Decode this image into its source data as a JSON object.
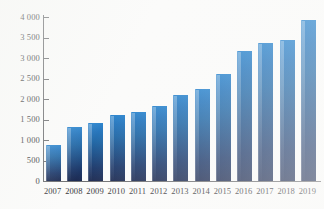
{
  "chart_data": {
    "type": "bar",
    "title": "",
    "xlabel": "",
    "ylabel": "",
    "categories": [
      "2007",
      "2008",
      "2009",
      "2010",
      "2011",
      "2012",
      "2013",
      "2014",
      "2015",
      "2016",
      "2017",
      "2018",
      "2019"
    ],
    "values": [
      880,
      1320,
      1420,
      1620,
      1680,
      1820,
      2100,
      2250,
      2600,
      3180,
      3370,
      3440,
      3930
    ],
    "series": [
      {
        "name": "",
        "values": [
          880,
          1320,
          1420,
          1620,
          1680,
          1820,
          2100,
          2250,
          2600,
          3180,
          3370,
          3440,
          3930
        ]
      }
    ],
    "ylim": [
      0,
      4000
    ],
    "ytick_values": [
      0,
      500,
      1000,
      1500,
      2000,
      2500,
      3000,
      3500,
      4000
    ],
    "ytick_labels": [
      "0",
      "500",
      "1 000",
      "1 500",
      "2 000",
      "2 500",
      "3 000",
      "3 500",
      "4 000"
    ],
    "grid": false,
    "legend": "none",
    "bar_color_top": "#2e86ce",
    "bar_color_bottom": "#1d2b52",
    "axis_color": "#6e6f72",
    "background": "#fbfbfa"
  }
}
